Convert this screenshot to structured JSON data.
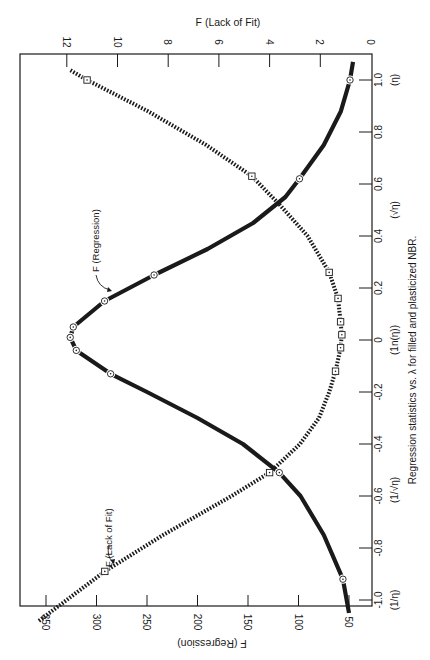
{
  "chart_data": {
    "type": "line",
    "orientation": "rotated 90° clockwise (page printed sideways)",
    "title": "",
    "caption": "Regression statistics vs. λ for filled and plasticized NBR.",
    "x": {
      "label": "λ",
      "ticks": [
        -1.0,
        -0.8,
        -0.6,
        -0.4,
        -0.2,
        0,
        0.2,
        0.4,
        0.6,
        0.8,
        1.0
      ],
      "tick_labels": [
        "-1.0",
        "-0.8",
        "-0.6",
        "-0.4",
        "-0.2",
        "0",
        "0.2",
        "0.4",
        "0.6",
        "0.8",
        "1.0"
      ],
      "range": [
        -1.15,
        1.1
      ],
      "transform_annotations": [
        {
          "at": -1.0,
          "text": "(1/η)"
        },
        {
          "at": -0.5,
          "text": "(1/√η)"
        },
        {
          "at": 0,
          "text": "(1n(η))"
        },
        {
          "at": 0.5,
          "text": "(√η)"
        },
        {
          "at": 1.0,
          "text": "(η)"
        }
      ]
    },
    "y_left": {
      "label": "F (Regression)",
      "ticks": [
        50,
        100,
        150,
        200,
        250,
        300,
        350
      ],
      "tick_labels": [
        "50",
        "100",
        "150",
        "200",
        "250",
        "300",
        "350"
      ],
      "range": [
        27,
        375
      ]
    },
    "y_right": {
      "label": "F (Lack of Fit)",
      "ticks": [
        0,
        2,
        4,
        6,
        8,
        10,
        12
      ],
      "tick_labels": [
        "0",
        "2",
        "4",
        "6",
        "8",
        "10",
        "12"
      ],
      "range": [
        0,
        14
      ]
    },
    "grid": false,
    "legend": "none (curves labeled by arrows)",
    "series": [
      {
        "name": "F (Regression)",
        "axis": "left",
        "style": "solid thick",
        "marker": "circle-dot",
        "points": [
          {
            "x": -0.92,
            "y": 56
          },
          {
            "x": -0.51,
            "y": 119
          },
          {
            "x": -0.13,
            "y": 286
          },
          {
            "x": -0.04,
            "y": 320
          },
          {
            "x": 0.01,
            "y": 326
          },
          {
            "x": 0.05,
            "y": 323
          },
          {
            "x": 0.15,
            "y": 292
          },
          {
            "x": 0.25,
            "y": 243
          },
          {
            "x": 0.62,
            "y": 99
          },
          {
            "x": 1.0,
            "y": 49
          }
        ],
        "curve": [
          {
            "x": -1.05,
            "y": 50
          },
          {
            "x": -0.92,
            "y": 56
          },
          {
            "x": -0.75,
            "y": 75
          },
          {
            "x": -0.6,
            "y": 98
          },
          {
            "x": -0.51,
            "y": 119
          },
          {
            "x": -0.4,
            "y": 155
          },
          {
            "x": -0.3,
            "y": 200
          },
          {
            "x": -0.2,
            "y": 250
          },
          {
            "x": -0.13,
            "y": 286
          },
          {
            "x": -0.04,
            "y": 320
          },
          {
            "x": 0.01,
            "y": 326
          },
          {
            "x": 0.05,
            "y": 323
          },
          {
            "x": 0.15,
            "y": 292
          },
          {
            "x": 0.25,
            "y": 243
          },
          {
            "x": 0.35,
            "y": 190
          },
          {
            "x": 0.45,
            "y": 145
          },
          {
            "x": 0.55,
            "y": 113
          },
          {
            "x": 0.62,
            "y": 99
          },
          {
            "x": 0.75,
            "y": 75
          },
          {
            "x": 0.88,
            "y": 58
          },
          {
            "x": 1.0,
            "y": 49
          },
          {
            "x": 1.07,
            "y": 46
          }
        ]
      },
      {
        "name": "F (Lack of Fit)",
        "axis": "right",
        "style": "dotted thick",
        "marker": "square-dot",
        "points": [
          {
            "x": -0.89,
            "y": 10.5
          },
          {
            "x": -0.51,
            "y": 4.0
          },
          {
            "x": -0.12,
            "y": 1.4
          },
          {
            "x": -0.03,
            "y": 1.2
          },
          {
            "x": 0.02,
            "y": 1.15
          },
          {
            "x": 0.07,
            "y": 1.2
          },
          {
            "x": 0.16,
            "y": 1.3
          },
          {
            "x": 0.26,
            "y": 1.65
          },
          {
            "x": 0.63,
            "y": 4.7
          },
          {
            "x": 1.0,
            "y": 11.2
          }
        ],
        "curve": [
          {
            "x": -1.08,
            "y": 13.1
          },
          {
            "x": -0.89,
            "y": 10.5
          },
          {
            "x": -0.75,
            "y": 8.2
          },
          {
            "x": -0.6,
            "y": 5.5
          },
          {
            "x": -0.51,
            "y": 4.0
          },
          {
            "x": -0.4,
            "y": 2.8
          },
          {
            "x": -0.3,
            "y": 2.05
          },
          {
            "x": -0.2,
            "y": 1.65
          },
          {
            "x": -0.12,
            "y": 1.4
          },
          {
            "x": -0.03,
            "y": 1.2
          },
          {
            "x": 0.02,
            "y": 1.15
          },
          {
            "x": 0.07,
            "y": 1.2
          },
          {
            "x": 0.16,
            "y": 1.3
          },
          {
            "x": 0.26,
            "y": 1.65
          },
          {
            "x": 0.4,
            "y": 2.5
          },
          {
            "x": 0.52,
            "y": 3.6
          },
          {
            "x": 0.63,
            "y": 4.7
          },
          {
            "x": 0.75,
            "y": 6.5
          },
          {
            "x": 0.88,
            "y": 8.8
          },
          {
            "x": 1.0,
            "y": 11.2
          },
          {
            "x": 1.04,
            "y": 11.9
          }
        ]
      }
    ],
    "annotations": [
      {
        "text": "F (Regression)",
        "points_to": "F (Regression) curve near λ≈0.15"
      },
      {
        "text": "F (Lack of Fit)",
        "points_to": "F (Lack of Fit) curve near λ≈-0.9"
      }
    ]
  },
  "labels": {
    "top_axis_title": "F (Lack of Fit)",
    "bottom_axis_title": "F (Regression)",
    "caption": "Regression statistics vs.  λ for filled and plasticized NBR.",
    "annot_regression": "F (Regression)",
    "annot_lack_of_fit": "F (Lack of Fit)"
  },
  "colors": {
    "ink": "#1a1a1a",
    "background": "#ffffff"
  }
}
